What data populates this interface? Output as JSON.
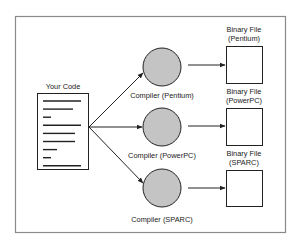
{
  "diagram": {
    "source": {
      "label": "Your Code",
      "code_line_lengths": [
        38,
        30,
        8,
        38,
        32,
        32,
        14,
        8,
        38
      ]
    },
    "compilers": [
      {
        "label": "Compiler (Pentium)"
      },
      {
        "label": "Compiler (PowerPC)"
      },
      {
        "label": "Compiler (SPARC)"
      }
    ],
    "outputs": [
      {
        "label_line1": "Binary File",
        "label_line2": "(Pentium)"
      },
      {
        "label_line1": "Binary File",
        "label_line2": "(PowerPC)"
      },
      {
        "label_line1": "Binary File",
        "label_line2": "(SPARC)"
      }
    ],
    "colors": {
      "compiler_fill": "#c4c4c4",
      "stroke": "#222222",
      "frame": "#8a8a8a"
    }
  }
}
